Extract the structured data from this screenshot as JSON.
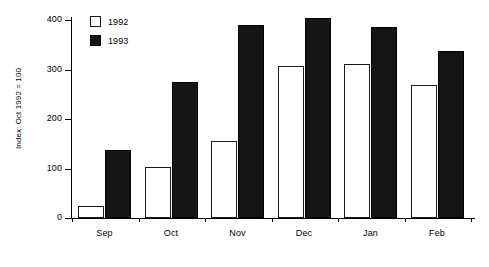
{
  "chart_data": {
    "type": "bar",
    "title": "",
    "subtitle": "",
    "xlabel": "",
    "ylabel": "Index: Oct 1992 = 100",
    "categories": [
      "Sep",
      "Oct",
      "Nov",
      "Dec",
      "Jan",
      "Feb"
    ],
    "series": [
      {
        "name": "1992",
        "color": "#ffffff",
        "values": [
          25,
          103,
          155,
          308,
          311,
          268
        ]
      },
      {
        "name": "1993",
        "color": "#151515",
        "values": [
          137,
          275,
          390,
          405,
          385,
          338
        ]
      }
    ],
    "ylim": [
      0,
      420
    ],
    "yticks": [
      0,
      100,
      200,
      300,
      400
    ],
    "ytick_labels": [
      "0",
      "100",
      "200",
      "300",
      "400"
    ],
    "grid": false,
    "legend_position": "top-left",
    "legend_entries": [
      "1992",
      "1993"
    ]
  }
}
